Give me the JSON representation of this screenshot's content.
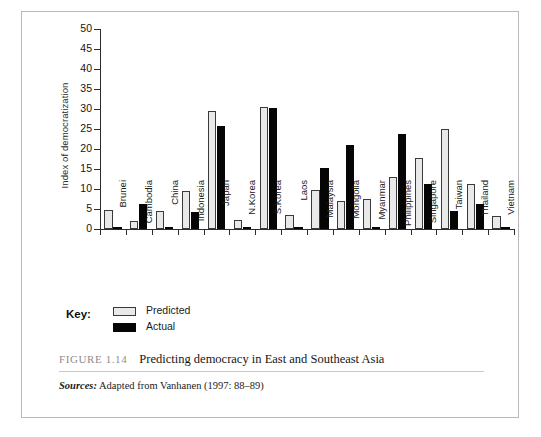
{
  "figure": {
    "number": "FIGURE 1.14",
    "caption": "Predicting democracy in East and Southeast Asia",
    "source_label": "Sources:",
    "source_text": "Adapted from Vanhanen (1997: 88–89)"
  },
  "legend": {
    "title": "Key:",
    "entries": [
      {
        "label": "Predicted",
        "color": "#e9e9e9"
      },
      {
        "label": "Actual",
        "color": "#050505"
      }
    ]
  },
  "chart_data": {
    "type": "bar",
    "title": "Predicting democracy in East and Southeast Asia",
    "xlabel": "",
    "ylabel": "Index of democratization",
    "ylim": [
      0,
      50
    ],
    "yticks": [
      0,
      5,
      10,
      15,
      20,
      25,
      30,
      35,
      40,
      45,
      50
    ],
    "grid": false,
    "legend_position": "below-left",
    "categories": [
      "Brunei",
      "Cambodia",
      "China",
      "Indonesia",
      "Japan",
      "N.Korea",
      "S.Korea",
      "Laos",
      "Malaysia",
      "Mongolia",
      "Myanmar",
      "Philippines",
      "Singapore",
      "Taiwan",
      "Thailand",
      "Vietnam"
    ],
    "series": [
      {
        "name": "Predicted",
        "color": "#e9e9e9",
        "values": [
          4.8,
          2.0,
          4.5,
          9.5,
          29.5,
          2.3,
          30.4,
          3.4,
          9.7,
          6.9,
          7.4,
          12.9,
          17.8,
          24.9,
          11.2,
          3.3
        ]
      },
      {
        "name": "Actual",
        "color": "#050505",
        "values": [
          0.3,
          6.2,
          0.3,
          4.2,
          25.8,
          0.2,
          30.2,
          0.2,
          15.3,
          20.9,
          0.2,
          23.8,
          11.2,
          4.5,
          6.3,
          0.2
        ]
      }
    ]
  }
}
